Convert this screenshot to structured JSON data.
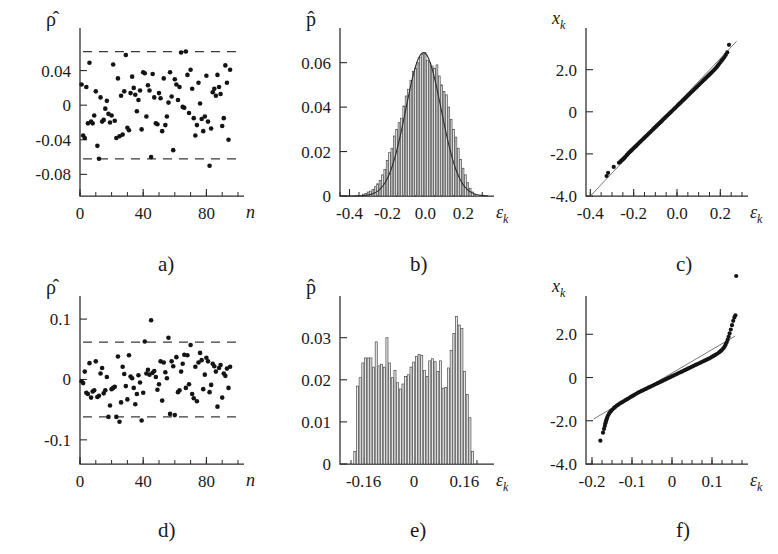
{
  "figure": {
    "rows": 2,
    "cols": 3,
    "panel_labels": [
      "a)",
      "b)",
      "c)",
      "d)",
      "e)",
      "f)"
    ],
    "ink_color": "#1a1a1a",
    "bar_fill": "#e8e8e8",
    "refline_color": "#6a6a6a"
  },
  "axis_names": {
    "rho_hat": "ρ̂",
    "p_hat": "p̂",
    "x_k": "x",
    "x_k_sub": "k",
    "n": "n",
    "eps": "ε",
    "eps_sub": "k"
  },
  "chart_data": [
    {
      "id": "a",
      "type": "scatter",
      "title": "a)",
      "xlabel": "n",
      "ylabel": "ρ̂",
      "xlim": [
        0,
        100
      ],
      "ylim": [
        -0.105,
        0.08
      ],
      "xticks": [
        0,
        40,
        80
      ],
      "xtick_labels": [
        "0",
        "40",
        "80"
      ],
      "xticks_minor_step": 10,
      "yticks": [
        0.04,
        0,
        -0.04,
        -0.08
      ],
      "ytick_labels": [
        "0.04",
        "0",
        "-0.04",
        "-0.08"
      ],
      "grid": false,
      "confidence_bounds": [
        0.062,
        -0.062
      ],
      "confidence_style": "dashed",
      "x": [
        1,
        2,
        3,
        4,
        5,
        6,
        7,
        8,
        9,
        10,
        11,
        12,
        13,
        14,
        15,
        16,
        17,
        18,
        19,
        20,
        21,
        22,
        23,
        24,
        25,
        26,
        27,
        28,
        29,
        30,
        31,
        32,
        33,
        34,
        35,
        36,
        37,
        38,
        39,
        40,
        41,
        42,
        43,
        44,
        45,
        46,
        47,
        48,
        49,
        50,
        51,
        52,
        53,
        54,
        55,
        56,
        57,
        58,
        59,
        60,
        61,
        62,
        63,
        64,
        65,
        66,
        67,
        68,
        69,
        70,
        71,
        72,
        73,
        74,
        75,
        76,
        77,
        78,
        79,
        80,
        81,
        82,
        83,
        84,
        85,
        86,
        87,
        88,
        89,
        90,
        91,
        92,
        93,
        94,
        95
      ],
      "y": [
        0.024,
        -0.035,
        -0.038,
        0.021,
        -0.021,
        0.049,
        -0.019,
        -0.021,
        -0.012,
        0.016,
        -0.047,
        -0.062,
        0.009,
        -0.019,
        -0.017,
        -0.004,
        0.005,
        -0.01,
        -0.02,
        -0.012,
        0.047,
        -0.018,
        -0.038,
        0.031,
        -0.036,
        0.011,
        -0.034,
        0.016,
        0.058,
        -0.026,
        -0.029,
        0.014,
        0.033,
        0.02,
        0.012,
        -0.007,
        0.006,
        0.017,
        -0.028,
        0.038,
        0.037,
        -0.013,
        0.023,
        0.017,
        -0.06,
        0.036,
        0.009,
        -0.021,
        -0.022,
        0.014,
        0.008,
        -0.03,
        0.031,
        -0.023,
        -0.013,
        0.003,
        0.038,
        0.01,
        -0.052,
        0.03,
        0.024,
        0.006,
        0.021,
        0.061,
        -0.002,
        -0.003,
        0.062,
        0.035,
        -0.009,
        0.041,
        0.019,
        -0.015,
        -0.035,
        -0.023,
        0.026,
        0.002,
        -0.016,
        -0.03,
        -0.013,
        0.034,
        -0.019,
        -0.07,
        -0.027,
        0.015,
        0.019,
        0.011,
        0.035,
        0.021,
        0.013,
        -0.024,
        -0.015,
        0.046,
        0.026,
        -0.04,
        0.041
      ]
    },
    {
      "id": "b",
      "type": "bar",
      "title": "b)",
      "xlabel": "εk",
      "ylabel": "p̂",
      "xlim": [
        -0.45,
        0.33
      ],
      "ylim": [
        0,
        0.072
      ],
      "xticks": [
        -0.4,
        -0.2,
        0.0,
        0.2
      ],
      "xtick_labels": [
        "-0.4",
        "-0.2",
        "0.0",
        "0.2"
      ],
      "xticks_minor_step": 0.05,
      "yticks": [
        0,
        0.02,
        0.04,
        0.06
      ],
      "ytick_labels": [
        "0",
        "0.02",
        "0.04",
        "0.06"
      ],
      "grid": false,
      "overlay": "gaussian-fit",
      "fit": {
        "mean": -0.01,
        "sigma": 0.093,
        "peak": 0.0645
      },
      "bin_width": 0.0125,
      "bin_centers": [
        -0.325,
        -0.3125,
        -0.3,
        -0.2875,
        -0.275,
        -0.2625,
        -0.25,
        -0.2375,
        -0.225,
        -0.2125,
        -0.2,
        -0.1875,
        -0.175,
        -0.1625,
        -0.15,
        -0.1375,
        -0.125,
        -0.1125,
        -0.1,
        -0.0875,
        -0.075,
        -0.0625,
        -0.05,
        -0.0375,
        -0.025,
        -0.0125,
        0,
        0.0125,
        0.025,
        0.0375,
        0.05,
        0.0625,
        0.075,
        0.0875,
        0.1,
        0.1125,
        0.125,
        0.1375,
        0.15,
        0.1625,
        0.175,
        0.1875,
        0.2,
        0.2125,
        0.225,
        0.2375,
        0.25,
        0.2625
      ],
      "values": [
        0.0008,
        0.0012,
        0.0018,
        0.0022,
        0.003,
        0.0042,
        0.0055,
        0.007,
        0.0095,
        0.012,
        0.016,
        0.0195,
        0.0215,
        0.027,
        0.03,
        0.033,
        0.035,
        0.0405,
        0.045,
        0.048,
        0.052,
        0.056,
        0.0575,
        0.06,
        0.0625,
        0.064,
        0.0645,
        0.061,
        0.06,
        0.0585,
        0.0575,
        0.059,
        0.054,
        0.05,
        0.047,
        0.0455,
        0.04,
        0.0345,
        0.03,
        0.0265,
        0.0215,
        0.0165,
        0.0125,
        0.0095,
        0.006,
        0.0035,
        0.0018,
        0.0008
      ]
    },
    {
      "id": "c",
      "type": "scatter",
      "title": "c)",
      "subtype": "normal-probability-plot",
      "xlabel": "εk",
      "ylabel": "xk",
      "xlim": [
        -0.42,
        0.3
      ],
      "ylim": [
        -4.0,
        3.6
      ],
      "xticks": [
        -0.4,
        -0.2,
        0.0,
        0.2
      ],
      "xtick_labels": [
        "-0.4",
        "-0.2",
        "0.0",
        "0.2"
      ],
      "xticks_minor_step": 0.05,
      "yticks": [
        2.0,
        0,
        -2.0,
        -4.0
      ],
      "ytick_labels": [
        "2.0",
        "0",
        "-2.0",
        "-4.0"
      ],
      "grid": false,
      "reference_line": {
        "p1": [
          -0.4,
          -4.0
        ],
        "p2": [
          0.275,
          3.35
        ]
      },
      "note": "points lie close to the straight reference line (Gaussian residuals)",
      "x": [
        -0.325,
        -0.318,
        -0.292,
        -0.268,
        -0.262,
        -0.258,
        -0.252,
        -0.248,
        -0.243,
        -0.238,
        -0.231,
        -0.225,
        -0.219,
        -0.213,
        -0.207,
        -0.201,
        -0.195,
        -0.189,
        -0.183,
        -0.177,
        -0.171,
        -0.165,
        -0.159,
        -0.153,
        -0.147,
        -0.141,
        -0.135,
        -0.129,
        -0.123,
        -0.117,
        -0.111,
        -0.105,
        -0.099,
        -0.093,
        -0.087,
        -0.081,
        -0.075,
        -0.069,
        -0.063,
        -0.057,
        -0.051,
        -0.045,
        -0.039,
        -0.033,
        -0.027,
        -0.021,
        -0.015,
        -0.009,
        -0.003,
        0.003,
        0.009,
        0.015,
        0.021,
        0.027,
        0.033,
        0.039,
        0.045,
        0.051,
        0.057,
        0.063,
        0.069,
        0.075,
        0.081,
        0.087,
        0.093,
        0.099,
        0.105,
        0.111,
        0.117,
        0.123,
        0.129,
        0.135,
        0.141,
        0.147,
        0.153,
        0.159,
        0.165,
        0.171,
        0.177,
        0.183,
        0.189,
        0.195,
        0.201,
        0.207,
        0.213,
        0.219,
        0.225,
        0.232,
        0.24
      ],
      "y": [
        -3.05,
        -2.9,
        -2.62,
        -2.42,
        -2.38,
        -2.33,
        -2.28,
        -2.24,
        -2.19,
        -2.13,
        -2.05,
        -1.98,
        -1.92,
        -1.86,
        -1.8,
        -1.74,
        -1.68,
        -1.62,
        -1.56,
        -1.5,
        -1.44,
        -1.38,
        -1.32,
        -1.26,
        -1.2,
        -1.14,
        -1.08,
        -1.02,
        -0.96,
        -0.9,
        -0.84,
        -0.78,
        -0.72,
        -0.66,
        -0.6,
        -0.54,
        -0.48,
        -0.42,
        -0.36,
        -0.3,
        -0.24,
        -0.18,
        -0.12,
        -0.06,
        0.0,
        0.06,
        0.12,
        0.18,
        0.24,
        0.3,
        0.36,
        0.42,
        0.48,
        0.54,
        0.6,
        0.66,
        0.72,
        0.78,
        0.84,
        0.9,
        0.96,
        1.02,
        1.08,
        1.14,
        1.2,
        1.26,
        1.32,
        1.38,
        1.44,
        1.5,
        1.56,
        1.62,
        1.68,
        1.74,
        1.8,
        1.86,
        1.92,
        1.98,
        2.05,
        2.12,
        2.2,
        2.28,
        2.36,
        2.44,
        2.52,
        2.6,
        2.7,
        2.82,
        3.18
      ]
    },
    {
      "id": "d",
      "type": "scatter",
      "title": "d)",
      "xlabel": "n",
      "ylabel": "ρ̂",
      "xlim": [
        0,
        100
      ],
      "ylim": [
        -0.14,
        0.125
      ],
      "xticks": [
        0,
        40,
        80
      ],
      "xtick_labels": [
        "0",
        "40",
        "80"
      ],
      "xticks_minor_step": 10,
      "yticks": [
        0.1,
        0,
        -0.1
      ],
      "ytick_labels": [
        "0.1",
        "0",
        "-0.1"
      ],
      "grid": false,
      "confidence_bounds": [
        0.062,
        -0.062
      ],
      "confidence_style": "dashed",
      "x": [
        1,
        2,
        3,
        4,
        5,
        6,
        7,
        8,
        9,
        10,
        11,
        12,
        13,
        14,
        15,
        16,
        17,
        18,
        19,
        20,
        21,
        22,
        23,
        24,
        25,
        26,
        27,
        28,
        29,
        30,
        31,
        32,
        33,
        34,
        35,
        36,
        37,
        38,
        39,
        40,
        41,
        42,
        43,
        44,
        45,
        46,
        47,
        48,
        49,
        50,
        51,
        52,
        53,
        54,
        55,
        56,
        57,
        58,
        59,
        60,
        61,
        62,
        63,
        64,
        65,
        66,
        67,
        68,
        69,
        70,
        71,
        72,
        73,
        74,
        75,
        76,
        77,
        78,
        79,
        80,
        81,
        82,
        83,
        84,
        85,
        86,
        87,
        88,
        89,
        90,
        91,
        92,
        93,
        94,
        95
      ],
      "y": [
        -0.003,
        -0.006,
        0.013,
        -0.022,
        -0.024,
        0.027,
        -0.03,
        -0.02,
        -0.018,
        0.03,
        -0.029,
        -0.027,
        0.01,
        0.019,
        -0.023,
        -0.018,
        0.004,
        -0.062,
        -0.043,
        -0.016,
        -0.014,
        -0.012,
        -0.062,
        0.038,
        -0.07,
        -0.038,
        0.021,
        0.009,
        -0.011,
        -0.033,
        0.04,
        0.005,
        0.002,
        -0.014,
        -0.041,
        -0.024,
        0.007,
        -0.005,
        -0.068,
        -0.022,
        0.063,
        0.01,
        0.016,
        0.008,
        0.098,
        0.011,
        0.014,
        0.004,
        -0.017,
        -0.008,
        0.03,
        -0.035,
        0.028,
        0.012,
        0.002,
        0.069,
        -0.057,
        0.03,
        0.022,
        -0.059,
        0.037,
        -0.021,
        -0.018,
        0.013,
        0.026,
        0.041,
        -0.014,
        0.04,
        -0.008,
        0.057,
        -0.024,
        -0.031,
        0.021,
        -0.036,
        0.028,
        0.044,
        0.032,
        -0.016,
        0.008,
        0.036,
        0.03,
        -0.021,
        -0.009,
        0.026,
        0.022,
        0.013,
        -0.045,
        0.019,
        0.024,
        -0.03,
        0.01,
        0.006,
        0.018,
        -0.014,
        0.021,
        -0.009
      ]
    },
    {
      "id": "e",
      "type": "bar",
      "title": "e)",
      "xlabel": "εk",
      "ylabel": "p̂",
      "xlim": [
        -0.235,
        0.235
      ],
      "ylim": [
        0,
        0.038
      ],
      "xticks": [
        -0.16,
        0,
        0.16
      ],
      "xtick_labels": [
        "-0.16",
        "0",
        "0.16"
      ],
      "xticks_minor_step": 0.04,
      "yticks": [
        0,
        0.01,
        0.02,
        0.03
      ],
      "ytick_labels": [
        "0",
        "0.01",
        "0.02",
        "0.03"
      ],
      "grid": false,
      "overlay": "none",
      "bin_width": 0.0085,
      "distribution_note": "broad, nearly uniform with peaks near the edges",
      "bin_centers": [
        -0.187,
        -0.1785,
        -0.17,
        -0.1615,
        -0.153,
        -0.1445,
        -0.136,
        -0.1275,
        -0.119,
        -0.1105,
        -0.102,
        -0.0935,
        -0.085,
        -0.0765,
        -0.068,
        -0.0595,
        -0.051,
        -0.0425,
        -0.034,
        -0.0255,
        -0.017,
        -0.0085,
        0.0,
        0.0085,
        0.017,
        0.0255,
        0.034,
        0.0425,
        0.051,
        0.0595,
        0.068,
        0.0765,
        0.085,
        0.0935,
        0.102,
        0.1105,
        0.119,
        0.1275,
        0.136,
        0.1445,
        0.153,
        0.1615,
        0.17,
        0.1785,
        0.187
      ],
      "values": [
        0.003,
        0.0185,
        0.0205,
        0.024,
        0.0252,
        0.0252,
        0.0252,
        0.023,
        0.029,
        0.0233,
        0.0237,
        0.023,
        0.03,
        0.024,
        0.0205,
        0.0222,
        0.0193,
        0.0178,
        0.019,
        0.0208,
        0.0212,
        0.023,
        0.0242,
        0.0255,
        0.026,
        0.0258,
        0.0222,
        0.0208,
        0.0245,
        0.025,
        0.0243,
        0.022,
        0.0245,
        0.018,
        0.0182,
        0.0228,
        0.027,
        0.031,
        0.035,
        0.033,
        0.0322,
        0.022,
        0.0165,
        0.011,
        0.003
      ]
    },
    {
      "id": "f",
      "type": "scatter",
      "title": "f)",
      "subtype": "normal-probability-plot",
      "xlabel": "εk",
      "ylabel": "xk",
      "xlim": [
        -0.215,
        0.175
      ],
      "ylim": [
        -4.0,
        3.4
      ],
      "xticks": [
        -0.2,
        -0.1,
        0,
        0.1
      ],
      "xtick_labels": [
        "-0.2",
        "-0.1",
        "0",
        "0.1"
      ],
      "xticks_minor_step": 0.025,
      "yticks": [
        2.0,
        0,
        -2.0,
        -4.0
      ],
      "ytick_labels": [
        "2.0",
        "0",
        "-2.0",
        "-4.0"
      ],
      "grid": false,
      "reference_line": {
        "p1": [
          -0.196,
          -1.92
        ],
        "p2": [
          0.158,
          1.92
        ]
      },
      "note": "S-shaped deviation from the straight line indicates non-Gaussian (light-tailed) residuals",
      "x": [
        -0.179,
        -0.1725,
        -0.17,
        -0.168,
        -0.1665,
        -0.165,
        -0.1635,
        -0.162,
        -0.16,
        -0.1575,
        -0.155,
        -0.152,
        -0.149,
        -0.1455,
        -0.142,
        -0.138,
        -0.134,
        -0.13,
        -0.1255,
        -0.121,
        -0.1165,
        -0.112,
        -0.1075,
        -0.103,
        -0.0985,
        -0.094,
        -0.0895,
        -0.085,
        -0.0805,
        -0.076,
        -0.0715,
        -0.067,
        -0.0625,
        -0.058,
        -0.0535,
        -0.049,
        -0.0445,
        -0.04,
        -0.0355,
        -0.031,
        -0.0265,
        -0.022,
        -0.0175,
        -0.013,
        -0.0085,
        -0.004,
        0.0005,
        0.005,
        0.0095,
        0.014,
        0.0185,
        0.023,
        0.0275,
        0.032,
        0.0365,
        0.041,
        0.0455,
        0.05,
        0.0545,
        0.059,
        0.0635,
        0.068,
        0.0725,
        0.077,
        0.0815,
        0.086,
        0.0905,
        0.095,
        0.0995,
        0.104,
        0.1085,
        0.113,
        0.1175,
        0.1215,
        0.125,
        0.1285,
        0.1315,
        0.134,
        0.1365,
        0.139,
        0.1415,
        0.144,
        0.147,
        0.15,
        0.153,
        0.156,
        0.1585,
        0.1605
      ],
      "y": [
        -2.92,
        -2.55,
        -2.38,
        -2.24,
        -2.12,
        -2.02,
        -1.93,
        -1.85,
        -1.76,
        -1.68,
        -1.61,
        -1.54,
        -1.48,
        -1.42,
        -1.36,
        -1.3,
        -1.25,
        -1.2,
        -1.15,
        -1.1,
        -1.05,
        -1.0,
        -0.95,
        -0.9,
        -0.85,
        -0.8,
        -0.75,
        -0.7,
        -0.66,
        -0.62,
        -0.58,
        -0.54,
        -0.5,
        -0.46,
        -0.42,
        -0.38,
        -0.34,
        -0.3,
        -0.26,
        -0.22,
        -0.18,
        -0.14,
        -0.1,
        -0.06,
        -0.02,
        0.02,
        0.06,
        0.1,
        0.14,
        0.18,
        0.22,
        0.26,
        0.3,
        0.34,
        0.38,
        0.42,
        0.46,
        0.5,
        0.54,
        0.58,
        0.62,
        0.66,
        0.7,
        0.74,
        0.78,
        0.82,
        0.86,
        0.9,
        0.95,
        1.0,
        1.05,
        1.1,
        1.16,
        1.22,
        1.28,
        1.35,
        1.43,
        1.52,
        1.62,
        1.74,
        1.88,
        2.04,
        2.22,
        2.42,
        2.62,
        2.78,
        2.88
      ]
    }
  ]
}
